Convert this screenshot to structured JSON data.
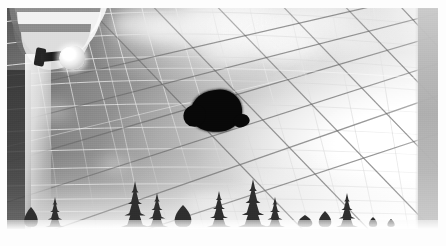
{
  "image": {
    "kind": "photograph",
    "palette": "grayscale",
    "border_color": "#fdfdfd",
    "sky_dark_gray": "#6f7174",
    "sky_mid_gray": "#9fa1a2",
    "sky_bright": "#fdfdfd",
    "net_line_color": "#d8d9d9",
    "cable_line_color": "#6c6e70",
    "silhouette_color": "#0b0b0c",
    "right_band_color": "#b7b8b8",
    "tree_color": "#2f3133"
  },
  "scene": {
    "title": "Dark object caught in an overhead net canopy against a bright sky",
    "subjects": [
      {
        "name": "net-canopy",
        "description": "large curved mesh netting seen from underneath"
      },
      {
        "name": "dark-silhouette",
        "description": "dark animal-shaped object snagged in the netting"
      },
      {
        "name": "dome-structure",
        "description": "striped curved structure at upper left"
      },
      {
        "name": "floodlight",
        "description": "bright white lamp on a dark bracket"
      },
      {
        "name": "cloud-bank",
        "description": "bright cumulus clouds across the upper sky"
      },
      {
        "name": "treeline",
        "description": "row of dark conifer silhouettes along the horizon"
      },
      {
        "name": "support-column",
        "description": "gray vertical band at the right edge"
      }
    ]
  },
  "clouds": [
    {
      "x": 104,
      "y": 2,
      "w": 66,
      "h": 30,
      "blur": "soft",
      "opacity": 0.7
    },
    {
      "x": 138,
      "y": 10,
      "w": 54,
      "h": 26,
      "blur": "soft",
      "opacity": 0.62
    },
    {
      "x": 168,
      "y": -6,
      "w": 96,
      "h": 44,
      "blur": "vsoft",
      "opacity": 0.88
    },
    {
      "x": 214,
      "y": 4,
      "w": 86,
      "h": 40,
      "blur": "vsoft",
      "opacity": 0.92
    },
    {
      "x": 246,
      "y": 22,
      "w": 70,
      "h": 30,
      "blur": "soft",
      "opacity": 0.78
    },
    {
      "x": 272,
      "y": -4,
      "w": 74,
      "h": 34,
      "blur": "vsoft",
      "opacity": 0.85
    },
    {
      "x": 196,
      "y": 36,
      "w": 48,
      "h": 20,
      "blur": "soft",
      "opacity": 0.55
    },
    {
      "x": 30,
      "y": 96,
      "w": 34,
      "h": 16,
      "blur": "soft",
      "opacity": 0.4
    },
    {
      "x": 92,
      "y": 150,
      "w": 30,
      "h": 13,
      "blur": "soft",
      "opacity": 0.45
    },
    {
      "x": 178,
      "y": 186,
      "w": 62,
      "h": 16,
      "blur": "soft",
      "opacity": 0.62
    },
    {
      "x": 236,
      "y": 168,
      "w": 56,
      "h": 14,
      "blur": "soft",
      "opacity": 0.55
    },
    {
      "x": 318,
      "y": 20,
      "w": 60,
      "h": 26,
      "blur": "vsoft",
      "opacity": 0.5
    }
  ],
  "dome_bands": [
    {
      "x": 6,
      "y": -16,
      "w": 96,
      "h": 58,
      "color": "#f2f2f2",
      "opacity": 0.95
    },
    {
      "x": 2,
      "y": -6,
      "w": 92,
      "h": 52,
      "color": "#7d7f81",
      "opacity": 0.85
    },
    {
      "x": 10,
      "y": 4,
      "w": 84,
      "h": 48,
      "color": "#f6f6f6",
      "opacity": 0.92
    },
    {
      "x": 6,
      "y": 16,
      "w": 78,
      "h": 42,
      "color": "#6f7173",
      "opacity": 0.78
    },
    {
      "x": 14,
      "y": 24,
      "w": 70,
      "h": 38,
      "color": "#ededed",
      "opacity": 0.8
    }
  ],
  "trees": [
    {
      "x": 24,
      "base": 62,
      "h": 20,
      "w": 13,
      "kind": "shrub"
    },
    {
      "x": 48,
      "base": 62,
      "h": 30,
      "w": 19,
      "kind": "conifer"
    },
    {
      "x": 128,
      "base": 62,
      "h": 46,
      "w": 28,
      "kind": "conifer"
    },
    {
      "x": 150,
      "base": 62,
      "h": 34,
      "w": 22,
      "kind": "conifer"
    },
    {
      "x": 176,
      "base": 62,
      "h": 22,
      "w": 16,
      "kind": "shrub"
    },
    {
      "x": 212,
      "base": 62,
      "h": 36,
      "w": 24,
      "kind": "conifer"
    },
    {
      "x": 246,
      "base": 62,
      "h": 48,
      "w": 30,
      "kind": "conifer"
    },
    {
      "x": 268,
      "base": 62,
      "h": 30,
      "w": 20,
      "kind": "conifer"
    },
    {
      "x": 298,
      "base": 62,
      "h": 12,
      "w": 14,
      "kind": "shrub"
    },
    {
      "x": 318,
      "base": 62,
      "h": 16,
      "w": 12,
      "kind": "shrub"
    },
    {
      "x": 340,
      "base": 62,
      "h": 34,
      "w": 22,
      "kind": "conifer"
    },
    {
      "x": 366,
      "base": 62,
      "h": 10,
      "w": 8,
      "kind": "shrub"
    },
    {
      "x": 384,
      "base": 62,
      "h": 8,
      "w": 7,
      "kind": "shrub"
    }
  ]
}
